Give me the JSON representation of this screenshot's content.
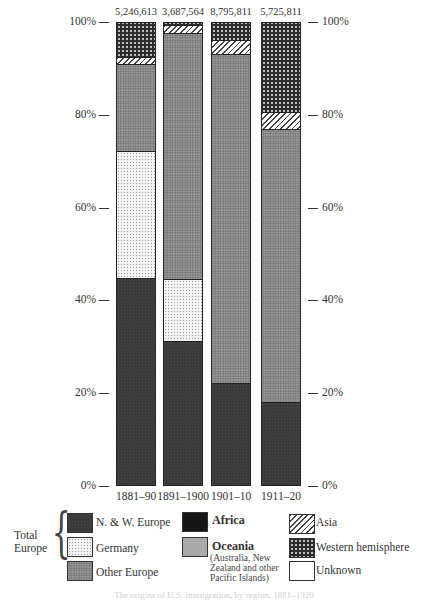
{
  "chart_data": {
    "type": "bar",
    "stacked": true,
    "normalized": true,
    "title": "",
    "caption": "The origins of U.S. immigration, by region, 1881–1920",
    "xlabel": "",
    "ylabel": "",
    "ylim": [
      0,
      100
    ],
    "y_ticks": [
      "0%",
      "20%",
      "40%",
      "60%",
      "80%",
      "100%"
    ],
    "y_axis_both_sides": true,
    "grid": false,
    "categories": [
      "1881–90",
      "1891–1900",
      "1901–10",
      "1911–20"
    ],
    "totals": [
      "5,246,613",
      "3,687,564",
      "8,795,811",
      "5,725,811"
    ],
    "series": [
      {
        "name": "N. & W. Europe",
        "group": "Total Europe",
        "pattern": "dark-stipple",
        "values": [
          44.6,
          31.0,
          22.0,
          17.9
        ]
      },
      {
        "name": "Germany",
        "group": "Total Europe",
        "pattern": "light-dots",
        "values": [
          27.4,
          13.4,
          0,
          0
        ]
      },
      {
        "name": "Other Europe",
        "group": "Total Europe",
        "pattern": "medium-gray-stipple",
        "values": [
          18.8,
          53.0,
          70.9,
          58.8
        ]
      },
      {
        "name": "Africa",
        "pattern": "solid-black",
        "values": [
          0,
          0,
          0,
          0
        ]
      },
      {
        "name": "Oceania",
        "note": "(Australia, New Zealand and other Pacific Islands)",
        "pattern": "solid-gray",
        "values": [
          0,
          0,
          0,
          0
        ]
      },
      {
        "name": "Asia",
        "pattern": "diagonal-hatch",
        "values": [
          1.5,
          1.7,
          3.0,
          3.7
        ]
      },
      {
        "name": "Western hemisphere",
        "pattern": "dark-checker",
        "values": [
          7.7,
          0.9,
          4.1,
          19.6
        ]
      },
      {
        "name": "Unknown",
        "pattern": "white",
        "values": [
          0,
          0,
          0,
          0
        ]
      }
    ],
    "legend_position": "bottom",
    "legend_group_label": "Total Europe"
  },
  "axis": {
    "left_ticks": [
      {
        "label": "100%",
        "pct": 100
      },
      {
        "label": "80%",
        "pct": 80
      },
      {
        "label": "60%",
        "pct": 60
      },
      {
        "label": "40%",
        "pct": 40
      },
      {
        "label": "20%",
        "pct": 20
      },
      {
        "label": "0%",
        "pct": 0
      }
    ]
  },
  "legend": {
    "group_label_line1": "Total",
    "group_label_line2": "Europe",
    "nw_europe": "N. & W. Europe",
    "germany": "Germany",
    "other_europe": "Other Europe",
    "africa": "Africa",
    "oceania": "Oceania",
    "oceania_note": "(Australia, New Zealand and other Pacific Islands)",
    "asia": "Asia",
    "western_hemisphere": "Western hemisphere",
    "unknown": "Unknown"
  },
  "caption": "The origins of U.S. immigration, by region, 1881–1920"
}
